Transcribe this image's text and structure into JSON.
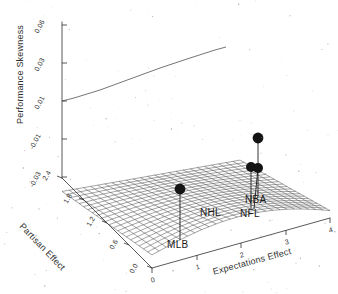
{
  "chart_data": {
    "type": "surface",
    "title": "",
    "xlabel": "Expectations Effect",
    "ylabel": "Partisan Effect",
    "zlabel": "Performance Skewness",
    "xticks": [
      "0",
      "1",
      "2",
      "3",
      "4"
    ],
    "yticks": [
      "0.0",
      "0.6",
      "1.2",
      "1.8",
      "2.4"
    ],
    "zticks": [
      "0.06",
      "0.03",
      "0.01",
      "-0.01",
      "-0.03"
    ],
    "xlim": [
      0,
      4
    ],
    "ylim": [
      0.0,
      2.4
    ],
    "zlim": [
      -0.03,
      0.06
    ],
    "grid": true,
    "legend": null,
    "mesh_style": "wireframe",
    "surface_shape": "saddle",
    "annotations": [
      {
        "label": "MLB",
        "x": 0.85,
        "y": 0.55,
        "z": -0.022
      },
      {
        "label": "NHL",
        "x": 1.95,
        "y": 1.05,
        "z": -0.016
      },
      {
        "label": "NFL",
        "x": 2.95,
        "y": 1.15,
        "z": -0.016
      },
      {
        "label": "NBA",
        "x": 2.95,
        "y": 1.8,
        "z": -0.006
      }
    ]
  },
  "axes": {
    "z": {
      "title": "Performance Skewness",
      "ticks": [
        {
          "label": "0.06"
        },
        {
          "label": "0.03"
        },
        {
          "label": "0.01"
        },
        {
          "label": "-0.01"
        },
        {
          "label": "-0.03"
        }
      ]
    },
    "x": {
      "title": "Expectations Effect",
      "ticks": [
        {
          "label": "0"
        },
        {
          "label": "1"
        },
        {
          "label": "2"
        },
        {
          "label": "3"
        },
        {
          "label": "4"
        }
      ]
    },
    "y": {
      "title": "Partisan Effect",
      "ticks": [
        {
          "label": "2.4"
        },
        {
          "label": "1.8"
        },
        {
          "label": "1.2"
        },
        {
          "label": "0.6"
        },
        {
          "label": "0.0"
        }
      ]
    }
  },
  "markers": [
    {
      "label": "MLB"
    },
    {
      "label": "NHL"
    },
    {
      "label": "NFL"
    },
    {
      "label": "NBA"
    }
  ]
}
